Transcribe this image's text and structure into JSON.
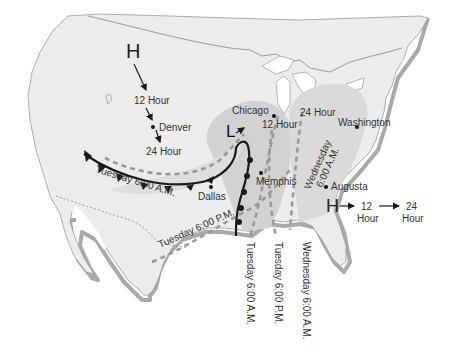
{
  "map": {
    "title": "U.S. weather map – storm and pressure system movement",
    "colors": {
      "land": "#ececec",
      "land_edge": "#9a9a9a",
      "coast_shadow": "#a9a9a9",
      "storm_band": "#d2d2d2",
      "storm_band_inner": "#dedede",
      "front": "#1a1a1a",
      "dashed_track": "#9a9a9a",
      "text": "#333333"
    },
    "pressure_systems": [
      {
        "symbol": "H",
        "id": "high-west"
      },
      {
        "symbol": "L",
        "id": "low-central"
      },
      {
        "symbol": "H",
        "id": "high-east"
      }
    ],
    "west_high_track": {
      "label_12": "12 Hour",
      "label_24": "24 Hour"
    },
    "cities": [
      {
        "name": "Denver"
      },
      {
        "name": "Chicago"
      },
      {
        "name": "Washington"
      },
      {
        "name": "Memphis"
      },
      {
        "name": "Dallas"
      },
      {
        "name": "Augusta"
      }
    ],
    "low_track": {
      "label_12": "12 Hour",
      "label_24": "24 Hour"
    },
    "front_positions": {
      "cold_front_label": "Tuesday 6:00 A.M.",
      "tue_pm_label": "Tuesday 6:00 P.M.",
      "wed_am_label_upper_1": "Wednesday",
      "wed_am_label_upper_2": "6:00 A.M."
    },
    "vertical_labels": [
      "Tuesday 6:00 A.M.",
      "Tuesday 6:00 P.M.",
      "Wednesday 6:00 A.M."
    ],
    "east_high_track": {
      "label_12_num": "12",
      "label_12_unit": "Hour",
      "label_24_num": "24",
      "label_24_unit": "Hour"
    }
  }
}
